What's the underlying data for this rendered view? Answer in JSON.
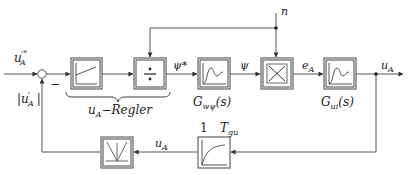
{
  "diagram": {
    "type": "control-loop block diagram",
    "colors": {
      "line": "#555555",
      "box": "#444444",
      "background": "#ffffff"
    },
    "signals": {
      "input_setpoint": "u'*A",
      "input_setpoint_main": "u",
      "input_setpoint_sup": "'*",
      "input_setpoint_sub": "A",
      "feedback_abs_main": "|u",
      "feedback_abs_sup": "'",
      "feedback_abs_sub": "A",
      "feedback_abs_close": "|",
      "minus_sign": "−",
      "psi_star": "ψ*",
      "psi": "ψ",
      "e_A_main": "e",
      "e_A_sub": "A",
      "n": "n",
      "u_A_out_main": "u",
      "u_A_out_sub": "A",
      "u_A_feedback_main": "u",
      "u_A_feedback_sub": "A"
    },
    "blocks": [
      {
        "id": "pi-controller",
        "icon": "ramp-icon"
      },
      {
        "id": "divider",
        "icon": "divide-icon",
        "symbol": "÷"
      },
      {
        "id": "G-w-psi",
        "icon": "step-response-icon",
        "label_main": "G",
        "label_sub": "wψ",
        "label_tail": "(s)"
      },
      {
        "id": "multiplier",
        "icon": "multiply-icon",
        "symbol": "×"
      },
      {
        "id": "G-ui",
        "icon": "step-response-icon",
        "label_main": "G",
        "label_sub": "ui",
        "label_tail": "(s)"
      },
      {
        "id": "pt1-filter",
        "icon": "pt1-curve-icon",
        "gain": "1",
        "time_const_main": "T",
        "time_const_sub": "gu"
      },
      {
        "id": "rectifier",
        "icon": "rectifier-icon"
      }
    ],
    "brace_label_main": "u",
    "brace_label_sub": "A",
    "brace_label_tail": "−Regler"
  }
}
